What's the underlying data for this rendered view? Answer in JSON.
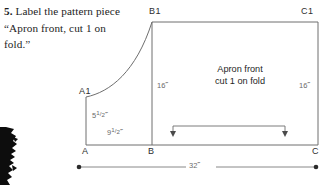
{
  "instruction": {
    "step_number": "5.",
    "text": "Label the pattern piece “Apron front, cut 1 on fold.”"
  },
  "diagram": {
    "corner_labels": {
      "b1": "B1",
      "c1": "C1",
      "a1": "A1",
      "a": "A",
      "b": "B",
      "c": "C"
    },
    "piece_label": {
      "line1": "Apron front",
      "line2": "cut 1 on fold"
    },
    "dimensions": {
      "left_height": "16˝",
      "right_height": "16˝",
      "short_height_whole": "5",
      "short_height_num": "1",
      "short_height_den": "2",
      "short_height_unit": "˝",
      "short_width_whole": "9",
      "short_width_num": "1",
      "short_width_den": "2",
      "short_width_unit": "˝",
      "baseline_width": "32˝"
    },
    "colors": {
      "outline": "#6e6e6e",
      "dimension_line": "#7a7a7a",
      "text": "#2e2e2e",
      "dim_text": "#6b6b6b",
      "blob": "#0d0d0d",
      "background": "#ffffff"
    }
  }
}
